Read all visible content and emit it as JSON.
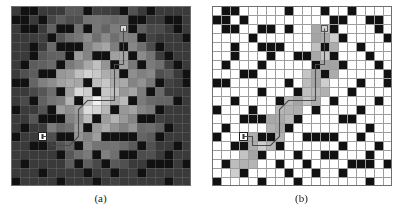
{
  "figure": {
    "type": "grid-search-visualization",
    "panel_count": 2,
    "background_color": "#ffffff"
  },
  "chart_data": {
    "type": "heatmap",
    "title": "",
    "xlabel": "",
    "ylabel": "",
    "grid_rows": 20,
    "grid_cols": 20,
    "cell_size_px": 9,
    "legend": [],
    "panels": [
      {
        "caption": "(a)",
        "name": "full-heuristic-expansion",
        "description": "Grid map with obstacles; every free cell shaded by its heuristic/cost value, darker at map edges and brighter near the center band. Solution path drawn from start (lower-left) to goal (upper-middle).",
        "shaded_all_free_cells": true,
        "grid_line_color": "#8a8a8a",
        "grid_line_visible": false,
        "obstacle_color": "#111111",
        "free_cell_color_range": [
          "#3a3a3a",
          "#f2f2f2"
        ],
        "start_cell": [
          14,
          3
        ],
        "goal_cell": [
          2,
          12
        ],
        "start_marker_color": "#ffffff",
        "goal_marker_color": "#d8d8d8",
        "path_color": "#4a4a4a"
      },
      {
        "caption": "(b)",
        "name": "focused-expansion",
        "description": "Same grid map; only the cells actually expanded by the search are shaded grey, forming a narrow corridor along the solution path. All other free cells remain white with visible grid lines.",
        "shaded_all_free_cells": false,
        "grid_line_color": "#9e9e9e",
        "grid_line_visible": true,
        "obstacle_color": "#111111",
        "free_cell_color": "#ffffff",
        "explored_cell_color_range": [
          "#8e8e8e",
          "#d6d6d6"
        ],
        "start_cell": [
          14,
          3
        ],
        "goal_cell": [
          2,
          12
        ],
        "start_marker_color": "#ffffff",
        "goal_marker_color": "#d0d0d0",
        "path_color": "#4a4a4a"
      }
    ],
    "obstacles": [
      [
        0,
        1
      ],
      [
        0,
        2
      ],
      [
        0,
        8
      ],
      [
        0,
        12
      ],
      [
        0,
        15
      ],
      [
        1,
        0
      ],
      [
        1,
        1
      ],
      [
        1,
        3
      ],
      [
        1,
        13
      ],
      [
        1,
        14
      ],
      [
        1,
        17
      ],
      [
        1,
        18
      ],
      [
        2,
        1
      ],
      [
        2,
        2
      ],
      [
        2,
        5
      ],
      [
        2,
        6
      ],
      [
        2,
        8
      ],
      [
        2,
        13
      ],
      [
        2,
        18
      ],
      [
        3,
        4
      ],
      [
        3,
        14
      ],
      [
        3,
        19
      ],
      [
        4,
        2
      ],
      [
        4,
        5
      ],
      [
        4,
        6
      ],
      [
        4,
        7
      ],
      [
        4,
        12
      ],
      [
        4,
        16
      ],
      [
        5,
        2
      ],
      [
        5,
        6
      ],
      [
        5,
        9
      ],
      [
        5,
        10
      ],
      [
        5,
        13
      ],
      [
        5,
        17
      ],
      [
        6,
        1
      ],
      [
        6,
        5
      ],
      [
        6,
        11
      ],
      [
        6,
        14
      ],
      [
        6,
        18
      ],
      [
        7,
        3
      ],
      [
        7,
        4
      ],
      [
        7,
        12
      ],
      [
        7,
        19
      ],
      [
        8,
        0
      ],
      [
        8,
        1
      ],
      [
        8,
        8
      ],
      [
        8,
        16
      ],
      [
        8,
        19
      ],
      [
        9,
        5
      ],
      [
        9,
        9
      ],
      [
        9,
        15
      ],
      [
        10,
        2
      ],
      [
        10,
        7
      ],
      [
        10,
        13
      ],
      [
        10,
        18
      ],
      [
        11,
        0
      ],
      [
        11,
        4
      ],
      [
        11,
        11
      ],
      [
        11,
        16
      ],
      [
        12,
        3
      ],
      [
        12,
        4
      ],
      [
        12,
        5
      ],
      [
        12,
        9
      ],
      [
        12,
        14
      ],
      [
        12,
        15
      ],
      [
        13,
        1
      ],
      [
        13,
        8
      ],
      [
        13,
        17
      ],
      [
        14,
        0
      ],
      [
        14,
        5
      ],
      [
        14,
        6
      ],
      [
        14,
        10
      ],
      [
        14,
        11
      ],
      [
        14,
        12
      ],
      [
        14,
        13
      ],
      [
        14,
        16
      ],
      [
        15,
        2
      ],
      [
        15,
        3
      ],
      [
        15,
        7
      ],
      [
        15,
        14
      ],
      [
        15,
        18
      ],
      [
        16,
        5
      ],
      [
        16,
        9
      ],
      [
        16,
        12
      ],
      [
        16,
        13
      ],
      [
        16,
        17
      ],
      [
        17,
        1
      ],
      [
        17,
        7
      ],
      [
        17,
        10
      ],
      [
        17,
        15
      ],
      [
        17,
        16
      ],
      [
        17,
        17
      ],
      [
        17,
        19
      ],
      [
        18,
        3
      ],
      [
        18,
        8
      ],
      [
        18,
        11
      ],
      [
        18,
        14
      ],
      [
        19,
        0
      ],
      [
        19,
        5
      ],
      [
        19,
        9
      ],
      [
        19,
        17
      ]
    ],
    "path": [
      [
        14,
        3
      ],
      [
        14,
        4
      ],
      [
        15,
        4
      ],
      [
        15,
        5
      ],
      [
        15,
        6
      ],
      [
        14,
        7
      ],
      [
        13,
        7
      ],
      [
        12,
        7
      ],
      [
        11,
        7
      ],
      [
        10,
        8
      ],
      [
        10,
        9
      ],
      [
        10,
        10
      ],
      [
        10,
        11
      ],
      [
        9,
        11
      ],
      [
        8,
        11
      ],
      [
        7,
        11
      ],
      [
        6,
        11
      ],
      [
        6,
        12
      ],
      [
        5,
        12
      ],
      [
        4,
        12
      ],
      [
        3,
        12
      ],
      [
        2,
        12
      ]
    ],
    "explored_cells_panel_b": [
      [
        2,
        11
      ],
      [
        2,
        12
      ],
      [
        2,
        13
      ],
      [
        3,
        11
      ],
      [
        3,
        12
      ],
      [
        3,
        13
      ],
      [
        4,
        11
      ],
      [
        4,
        12
      ],
      [
        4,
        13
      ],
      [
        5,
        11
      ],
      [
        5,
        12
      ],
      [
        5,
        13
      ],
      [
        6,
        11
      ],
      [
        6,
        12
      ],
      [
        6,
        13
      ],
      [
        7,
        10
      ],
      [
        7,
        11
      ],
      [
        7,
        12
      ],
      [
        7,
        13
      ],
      [
        8,
        10
      ],
      [
        8,
        11
      ],
      [
        8,
        12
      ],
      [
        9,
        9
      ],
      [
        9,
        10
      ],
      [
        9,
        11
      ],
      [
        9,
        12
      ],
      [
        10,
        8
      ],
      [
        10,
        9
      ],
      [
        10,
        10
      ],
      [
        10,
        11
      ],
      [
        11,
        7
      ],
      [
        11,
        8
      ],
      [
        11,
        9
      ],
      [
        12,
        6
      ],
      [
        12,
        7
      ],
      [
        12,
        8
      ],
      [
        13,
        6
      ],
      [
        13,
        7
      ],
      [
        14,
        4
      ],
      [
        14,
        5
      ],
      [
        14,
        6
      ],
      [
        14,
        7
      ],
      [
        15,
        3
      ],
      [
        15,
        4
      ],
      [
        15,
        5
      ],
      [
        15,
        6
      ],
      [
        16,
        3
      ],
      [
        16,
        4
      ],
      [
        16,
        5
      ],
      [
        17,
        2
      ],
      [
        17,
        3
      ],
      [
        17,
        4
      ],
      [
        18,
        2
      ],
      [
        18,
        3
      ]
    ]
  },
  "captions": {
    "left": "(a)",
    "right": "(b)"
  }
}
